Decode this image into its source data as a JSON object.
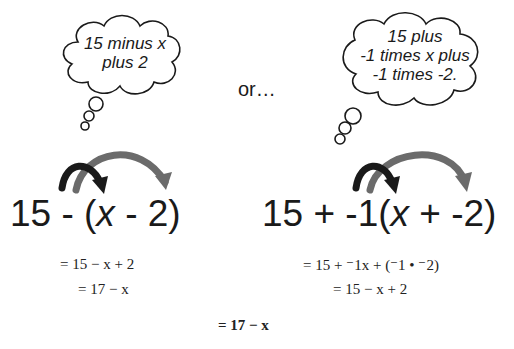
{
  "left": {
    "thought": [
      "15 minus x",
      "plus 2"
    ],
    "expression": {
      "a": "15 - (",
      "x": "x",
      "b": " - 2)"
    },
    "steps": [
      "= 15 − x + 2",
      "= 17 − x"
    ]
  },
  "connector": "or…",
  "right": {
    "thought": [
      "15 plus",
      "-1 times x plus",
      "-1 times -2."
    ],
    "expression": {
      "a": "15 + -1(",
      "x": "x",
      "b": " + -2)"
    },
    "steps": [
      "= 15 + ⁻1x + (⁻1 • ⁻2)",
      "= 15 − x + 2"
    ]
  },
  "final": "= 17 − x",
  "colors": {
    "dark_arrow": "#1a1a1a",
    "gray_arrow": "#6b6b6b"
  }
}
